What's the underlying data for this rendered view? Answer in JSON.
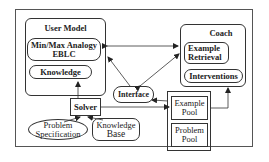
{
  "diagram": {
    "user_model": {
      "title": "User Model",
      "components": [
        "Min/Max Analogy EBLC",
        "Knowledge"
      ],
      "component_lines": {
        "minmax_line1": "Min/Max Analogy",
        "minmax_line2": "EBLC",
        "knowledge": "Knowledge"
      }
    },
    "coach": {
      "title": "Coach",
      "components": [
        "Example Retrieval",
        "Interventions"
      ],
      "component_lines": {
        "retrieval_line1": "Example",
        "retrieval_line2": "Retrieval",
        "interventions": "Interventions"
      }
    },
    "interface": {
      "label": "Interface"
    },
    "solver": {
      "label": "Solver"
    },
    "problem_specification": {
      "line1": "Problem",
      "line2": "Specification"
    },
    "knowledge_base": {
      "line1": "Knowledge",
      "line2": "Base"
    },
    "pools": {
      "example_pool": {
        "line1": "Example",
        "line2": "Pool"
      },
      "problem_pool": {
        "line1": "Problem",
        "line2": "Pool"
      }
    },
    "edges": [
      {
        "from": "User Model",
        "to": "Coach",
        "direction": "both"
      },
      {
        "from": "Interface",
        "to": "User Model",
        "direction": "forward"
      },
      {
        "from": "Interface",
        "to": "Coach",
        "direction": "both"
      },
      {
        "from": "Solver",
        "to": "User Model",
        "direction": "forward"
      },
      {
        "from": "Problem Specification",
        "to": "Solver",
        "direction": "forward"
      },
      {
        "from": "Knowledge Base",
        "to": "Solver",
        "direction": "forward"
      },
      {
        "from": "Solver",
        "to": "Example Pool",
        "direction": "forward"
      },
      {
        "from": "Example Pool",
        "to": "Interface",
        "direction": "forward"
      },
      {
        "from": "Example Pool",
        "to": "Coach",
        "direction": "forward"
      }
    ]
  }
}
